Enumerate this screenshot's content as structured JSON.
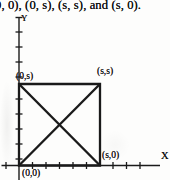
{
  "caption": {
    "text": "0, 0), (0, s), (s, s), and (s, 0)."
  },
  "figure": {
    "axis_labels": {
      "x": "X",
      "y": "Y"
    },
    "vertex_labels": {
      "origin": "(0,0)",
      "top_left": "(0,s)",
      "top_right": "(s,s)",
      "bottom_right": "(s,0)"
    },
    "colors": {
      "ink": "#1a1a1a",
      "paper": "#fdfdfc"
    }
  }
}
